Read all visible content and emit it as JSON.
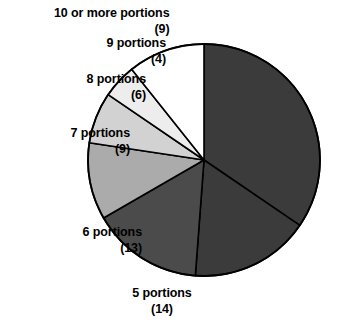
{
  "chart_data": {
    "type": "pie",
    "title": "",
    "subtitle": "",
    "xlabel": "",
    "ylabel": "",
    "legend_position": "none",
    "grid": false,
    "total": 55,
    "start_angle_deg": 0,
    "direction": "clockwise",
    "categories": [
      "4 or fewer portions",
      "5 portions",
      "6 portions",
      "7 portions",
      "8 portions",
      "9 portions",
      "10 or more portions"
    ],
    "values": [
      0,
      14,
      13,
      9,
      6,
      4,
      9
    ],
    "slices": [
      {
        "id": "slice-major",
        "label": "",
        "value_text": "",
        "value": 29,
        "fill": "#3b3b3b",
        "stroke": "#000000",
        "labeled": false
      },
      {
        "id": "slice-5",
        "label": "5 portions",
        "value_text": "(14)",
        "value": 14,
        "fill": "#3b3b3b",
        "stroke": "#000000",
        "labeled": true
      },
      {
        "id": "slice-6",
        "label": "6 portions",
        "value_text": "(13)",
        "value": 13,
        "fill": "#4b4b4b",
        "stroke": "#000000",
        "labeled": true
      },
      {
        "id": "slice-7",
        "label": "7 portions",
        "value_text": "(9)",
        "value": 9,
        "fill": "#ababab",
        "stroke": "#000000",
        "labeled": true
      },
      {
        "id": "slice-8",
        "label": "8 portions",
        "value_text": "(6)",
        "value": 6,
        "fill": "#d2d2d2",
        "stroke": "#000000",
        "labeled": true
      },
      {
        "id": "slice-9",
        "label": "9 portions",
        "value_text": "(4)",
        "value": 4,
        "fill": "#ededed",
        "stroke": "#000000",
        "labeled": true
      },
      {
        "id": "slice-10plus",
        "label": "10 or more portions",
        "value_text": "(9)",
        "value": 9,
        "fill": "#ffffff",
        "stroke": "#000000",
        "labeled": true
      }
    ]
  },
  "labels": {
    "ten_or_more": {
      "name": "10 or more portions",
      "value": "(9)"
    },
    "nine": {
      "name": "9 portions",
      "value": "(4)"
    },
    "eight": {
      "name": "8 portions",
      "value": "(6)"
    },
    "seven": {
      "name": "7 portions",
      "value": "(9)"
    },
    "six": {
      "name": "6 portions",
      "value": "(13)"
    },
    "five": {
      "name": "5 portions",
      "value": "(14)"
    }
  },
  "geometry": {
    "center_x": 204,
    "center_y": 160,
    "radius": 116
  },
  "colors": {
    "background": "#ffffff",
    "outline": "#000000",
    "text": "#000000"
  }
}
